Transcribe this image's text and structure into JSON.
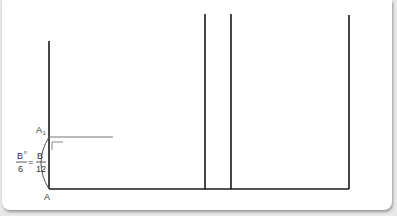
{
  "diagram": {
    "labels": {
      "top_point": "A",
      "top_point_sub": "1",
      "bottom_point": "A",
      "fraction_left_num": "B",
      "fraction_left_sup": "n",
      "fraction_left_den": "6",
      "equals": "=",
      "fraction_right_num": "B",
      "fraction_right_den": "12"
    },
    "colors": {
      "line": "#1a1a1a",
      "thin_line": "#666666",
      "background": "#ffffff"
    }
  }
}
